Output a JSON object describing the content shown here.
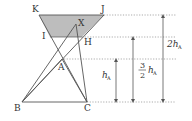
{
  "diagram": {
    "colors": {
      "line": "#555555",
      "fill": "#bdbdbd",
      "dotted": "#888888",
      "text": "#333333"
    },
    "points": {
      "K": {
        "label": "K",
        "x": 39,
        "y": 15
      },
      "J": {
        "label": "J",
        "x": 104,
        "y": 15
      },
      "I": {
        "label": "I",
        "x": 50,
        "y": 37
      },
      "H": {
        "label": "H",
        "x": 82,
        "y": 37
      },
      "X": {
        "label": "X",
        "x": 76,
        "y": 24
      },
      "A": {
        "label": "A",
        "x": 62,
        "y": 59
      },
      "B": {
        "label": "B",
        "x": 22,
        "y": 102
      },
      "C": {
        "label": "C",
        "x": 87,
        "y": 102
      }
    },
    "levels": [
      {
        "name": "top",
        "y": 15
      },
      {
        "name": "mid",
        "y": 37
      },
      {
        "name": "a-level",
        "y": 59
      },
      {
        "name": "base",
        "y": 102
      }
    ],
    "measures": [
      {
        "name": "h-a",
        "x": 116,
        "y_top": 59,
        "y_bottom": 102,
        "label_main": "h",
        "label_sub": "A"
      },
      {
        "name": "three-halves-h-a",
        "x": 133,
        "y_top": 37,
        "y_bottom": 102,
        "label_num": "3",
        "label_den": "2",
        "label_main": "h",
        "label_sub": "A"
      },
      {
        "name": "two-h-a",
        "x": 163,
        "y_top": 15,
        "y_bottom": 102,
        "label_main": "2h",
        "label_sub": "A"
      }
    ],
    "labels": {
      "K": "K",
      "J": "J",
      "I": "I",
      "H": "H",
      "X": "X",
      "A": "A",
      "B": "B",
      "C": "C",
      "h_a_main": "h",
      "h_a_sub": "A",
      "frac_num": "3",
      "frac_den": "2",
      "frac_main": "h",
      "frac_sub": "A",
      "two_h_main": "2h",
      "two_h_sub": "A"
    }
  }
}
